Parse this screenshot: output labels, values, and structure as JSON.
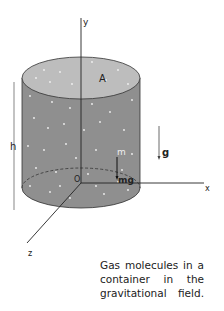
{
  "diagram": {
    "labels": {
      "y_axis": "y",
      "x_axis": "x",
      "z_axis": "z",
      "origin": "O",
      "area": "A",
      "height": "h",
      "mass": "m",
      "weight": "mg",
      "gravity": "g"
    },
    "colors": {
      "cylinder_body": "#8f8f8f",
      "cylinder_top": "#bdbdbd",
      "molecule_dot": "#f2f2f2",
      "line": "#222222"
    },
    "caption_lines": [
      "Gas molecules in a",
      "container in the",
      "gravitational field."
    ]
  }
}
